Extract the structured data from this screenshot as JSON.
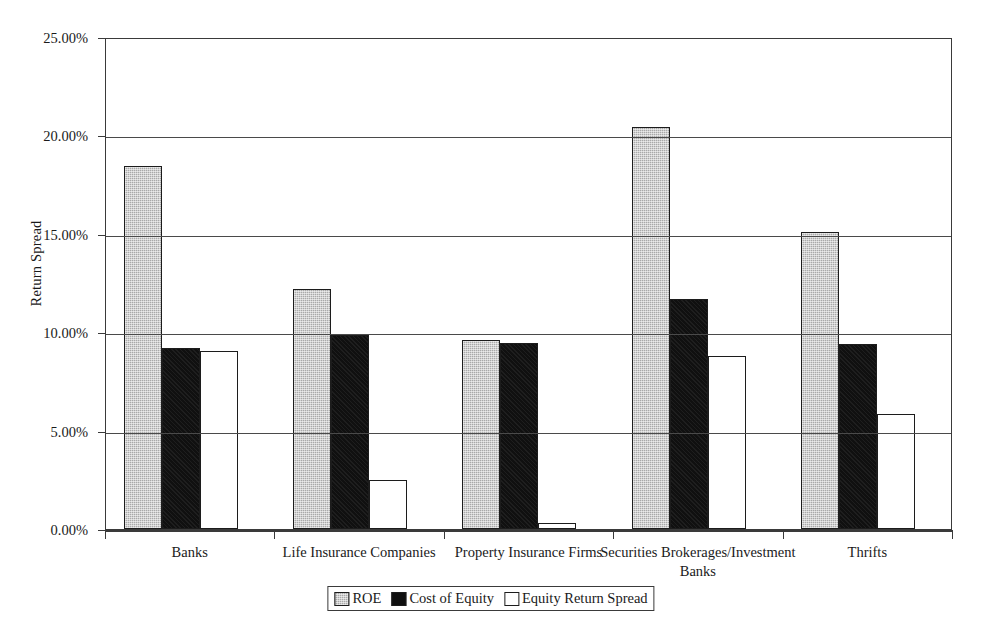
{
  "chart_data": {
    "type": "bar",
    "title": "",
    "xlabel": "",
    "ylabel": "Return Spread",
    "ylim": [
      0,
      25
    ],
    "ytick_labels": [
      "0.00%",
      "5.00%",
      "10.00%",
      "15.00%",
      "20.00%",
      "25.00%"
    ],
    "ytick_values": [
      0,
      5,
      10,
      15,
      20,
      25
    ],
    "grid": true,
    "legend_position": "bottom",
    "categories": [
      "Banks",
      "Life Insurance Companies",
      "Property Insurance Firms",
      "Securities Brokerages/Investment Banks",
      "Thrifts"
    ],
    "series": [
      {
        "name": "ROE",
        "key": "roe",
        "color": "#a9a9a9",
        "values": [
          18.45,
          12.2,
          9.6,
          20.45,
          15.1
        ]
      },
      {
        "name": "Cost of Equity",
        "key": "coe",
        "color": "#101010",
        "values": [
          9.2,
          9.85,
          9.45,
          11.7,
          9.4
        ]
      },
      {
        "name": "Equity Return Spread",
        "key": "spread",
        "color": "#ffffff",
        "values": [
          9.05,
          2.5,
          0.3,
          8.8,
          5.85
        ]
      }
    ]
  },
  "axis": {
    "y_title": "Return Spread"
  },
  "legend": {
    "items": [
      {
        "label": "ROE",
        "key": "roe"
      },
      {
        "label": "Cost of Equity",
        "key": "coe"
      },
      {
        "label": "Equity Return Spread",
        "key": "spread"
      }
    ]
  },
  "colors": {
    "axis": "#3a3a3a",
    "grid": "#4a4a4a",
    "bar_outline": "#1c1c1c",
    "background": "#ffffff"
  }
}
